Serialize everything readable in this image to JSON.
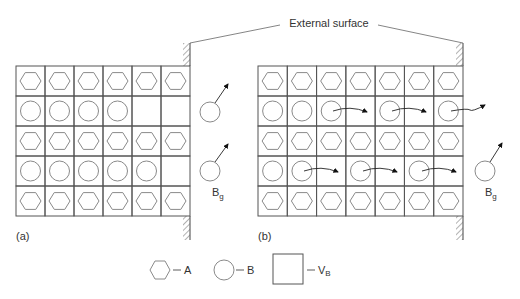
{
  "figure": {
    "top_label": "External surface",
    "panel_a": {
      "label": "(a)",
      "cols": 6,
      "rows": [
        [
          "A",
          "A",
          "A",
          "A",
          "A",
          "A"
        ],
        [
          "B",
          "B",
          "B",
          "B",
          "V",
          "V"
        ],
        [
          "A",
          "A",
          "A",
          "A",
          "A",
          "A"
        ],
        [
          "B",
          "B",
          "B",
          "B",
          "B",
          "V"
        ],
        [
          "A",
          "A",
          "A",
          "A",
          "A",
          "A"
        ]
      ],
      "gas_label": "B",
      "gas_sub": "g"
    },
    "panel_b": {
      "label": "(b)",
      "cols": 7,
      "rows": [
        [
          "A",
          "A",
          "A",
          "A",
          "A",
          "A",
          "A"
        ],
        [
          "B",
          "B",
          "B",
          "V",
          "B",
          "V",
          "B"
        ],
        [
          "A",
          "A",
          "A",
          "A",
          "A",
          "A",
          "A"
        ],
        [
          "B",
          "B",
          "V",
          "B",
          "V",
          "B",
          "V"
        ],
        [
          "A",
          "A",
          "A",
          "A",
          "A",
          "A",
          "A"
        ]
      ],
      "gas_label": "B",
      "gas_sub": "g"
    },
    "legend": [
      {
        "symbol": "hexagon",
        "label": "A"
      },
      {
        "symbol": "circle",
        "label": "B"
      },
      {
        "symbol": "square",
        "label": "V",
        "sub": "B"
      }
    ],
    "colors": {
      "line": "#555555",
      "shape": "#8a8a8a",
      "text": "#333333"
    }
  }
}
